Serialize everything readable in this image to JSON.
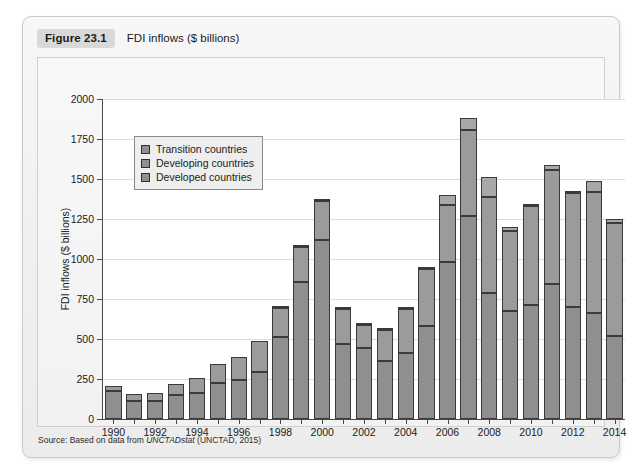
{
  "figure": {
    "badge": "Figure 23.1",
    "title": "FDI inflows ($ billions)",
    "source_prefix": "Source: Based on data from ",
    "source_italic": "UNCTADstat",
    "source_suffix": " (UNCTAD, 2015)"
  },
  "legend": {
    "position": "inside-top-left",
    "items": [
      {
        "label": "Transition countries",
        "color": "#a8a8a8"
      },
      {
        "label": "Developing countries",
        "color": "#9b9b9b"
      },
      {
        "label": "Developed countries",
        "color": "#8f8f8f"
      }
    ]
  },
  "chart_data": {
    "type": "bar",
    "stacked": true,
    "title": "FDI inflows ($ billions)",
    "xlabel": "",
    "ylabel": "FDI inflows ($ billions)",
    "ylim": [
      0,
      2000
    ],
    "ytick_step": 250,
    "yticks": [
      0,
      250,
      500,
      750,
      1000,
      1250,
      1500,
      1750,
      2000
    ],
    "ytick_labels": [
      "0",
      "250",
      "500",
      "750",
      "1000",
      "1250",
      "1500",
      "1750",
      "2000"
    ],
    "grid": true,
    "grid_axis": "y",
    "categories": [
      "1990",
      "1991",
      "1992",
      "1993",
      "1994",
      "1995",
      "1996",
      "1997",
      "1998",
      "1999",
      "2000",
      "2001",
      "2002",
      "2003",
      "2004",
      "2005",
      "2006",
      "2007",
      "2008",
      "2009",
      "2010",
      "2011",
      "2012",
      "2013",
      "2014"
    ],
    "xtick_labels_shown": [
      "1990",
      "1992",
      "1994",
      "1996",
      "1998",
      "2000",
      "2002",
      "2004",
      "2006",
      "2008",
      "2010",
      "2012",
      "2014"
    ],
    "series": [
      {
        "name": "Developed countries",
        "color": "#8f8f8f",
        "values": [
          175,
          115,
          115,
          150,
          160,
          225,
          245,
          295,
          510,
          855,
          1120,
          470,
          445,
          360,
          410,
          580,
          980,
          1270,
          790,
          675,
          715,
          845,
          700,
          660,
          520
        ]
      },
      {
        "name": "Developing countries",
        "color": "#9b9b9b",
        "values": [
          30,
          40,
          50,
          70,
          95,
          120,
          145,
          190,
          185,
          220,
          240,
          220,
          145,
          195,
          280,
          355,
          360,
          535,
          600,
          500,
          615,
          710,
          710,
          760,
          705
        ]
      },
      {
        "name": "Transition countries",
        "color": "#a8a8a8",
        "values": [
          0,
          0,
          0,
          0,
          0,
          0,
          0,
          0,
          5,
          10,
          5,
          10,
          5,
          10,
          10,
          10,
          60,
          75,
          120,
          25,
          15,
          30,
          15,
          70,
          25
        ]
      }
    ],
    "totals": [
      205,
      155,
      165,
      220,
      255,
      345,
      390,
      485,
      700,
      1085,
      1365,
      700,
      595,
      565,
      700,
      945,
      1400,
      1880,
      1510,
      1200,
      1345,
      1585,
      1425,
      1490,
      1250
    ]
  }
}
